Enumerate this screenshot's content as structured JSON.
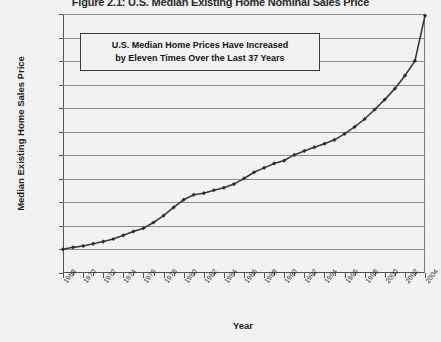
{
  "figure": {
    "title": "Figure 2.1: U.S. Median Existing Home Nominal Sales Price",
    "annotation_line1": "U.S. Median Home Prices Have Increased",
    "annotation_line2": "by Eleven Times Over the Last 37 Years"
  },
  "chart_data": {
    "type": "line",
    "title": "Figure 2.1: U.S. Median Existing Home Nominal Sales Price",
    "xlabel": "Year",
    "ylabel": "Median Existing Home Sales Price",
    "xlim": [
      1968,
      2004
    ],
    "ylim": [
      0,
      220000
    ],
    "grid": true,
    "legend": "none",
    "marker": "diamond",
    "line_color": "#3a3a3a",
    "ytick_labels": [
      "$220,000",
      "$200,000",
      "$180,000",
      "$160,000",
      "$140,000",
      "$120,000",
      "$100,000",
      "$80,000",
      "$60,000",
      "$40,000",
      "$20,000",
      "$0"
    ],
    "ytick_values": [
      220000,
      200000,
      180000,
      160000,
      140000,
      120000,
      100000,
      80000,
      60000,
      40000,
      20000,
      0
    ],
    "xtick_labels": [
      "1968",
      "1970",
      "1972",
      "1974",
      "1976",
      "1978",
      "1980",
      "1982",
      "1984",
      "1986",
      "1988",
      "1990",
      "1992",
      "1994",
      "1996",
      "1998",
      "2000",
      "2002",
      "2004"
    ],
    "xtick_values": [
      1968,
      1970,
      1972,
      1974,
      1976,
      1978,
      1980,
      1982,
      1984,
      1986,
      1988,
      1990,
      1992,
      1994,
      1996,
      1998,
      2000,
      2002,
      2004
    ],
    "x": [
      1968,
      1969,
      1970,
      1971,
      1972,
      1973,
      1974,
      1975,
      1976,
      1977,
      1978,
      1979,
      1980,
      1981,
      1982,
      1983,
      1984,
      1985,
      1986,
      1987,
      1988,
      1989,
      1990,
      1991,
      1992,
      1993,
      1994,
      1995,
      1996,
      1997,
      1998,
      1999,
      2000,
      2001,
      2002,
      2003,
      2004
    ],
    "values": [
      20100,
      21800,
      23000,
      24800,
      26700,
      28900,
      32000,
      35300,
      38100,
      42900,
      48700,
      55700,
      62200,
      66400,
      67800,
      70300,
      72400,
      75500,
      80300,
      85600,
      89300,
      93100,
      95500,
      100300,
      103700,
      106800,
      109800,
      113100,
      118200,
      124100,
      130800,
      138900,
      147300,
      156600,
      167600,
      180200,
      218600
    ],
    "annotations": [
      {
        "text": "U.S. Median Home Prices Have Increased by Eleven Times Over the Last 37 Years",
        "x_range": [
          1970,
          1994
        ],
        "y_range": [
          186000,
          208000
        ]
      }
    ]
  }
}
